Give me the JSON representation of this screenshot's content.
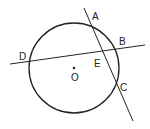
{
  "diagram": {
    "type": "geometry",
    "circle": {
      "center_label": "O",
      "cx": 74,
      "cy": 68,
      "r": 45
    },
    "lines": [
      {
        "name": "secant-DB",
        "x1": 10,
        "y1": 64,
        "x2": 145,
        "y2": 45
      },
      {
        "name": "secant-AC",
        "x1": 84,
        "y1": 8,
        "x2": 133,
        "y2": 121
      }
    ],
    "points": [
      {
        "label": "A",
        "x": 97,
        "y": 19
      },
      {
        "label": "B",
        "x": 123,
        "y": 44
      },
      {
        "label": "C",
        "x": 123,
        "y": 90
      },
      {
        "label": "D",
        "x": 20,
        "y": 59
      },
      {
        "label": "E",
        "x": 96,
        "y": 67
      },
      {
        "label": "O",
        "x": 73,
        "y": 80
      }
    ],
    "stroke_color": "#222222"
  }
}
